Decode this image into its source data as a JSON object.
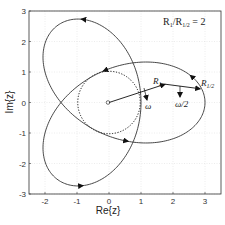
{
  "chart_data": {
    "type": "line",
    "title": "",
    "xlabel": "Re{z}",
    "ylabel": "Im{z}",
    "xlim": [
      -2.5,
      3.5
    ],
    "ylim": [
      -3,
      3
    ],
    "xticks": [
      -2,
      -1,
      0,
      1,
      2,
      3
    ],
    "yticks": [
      3,
      2,
      1,
      0,
      -1,
      -2,
      -3
    ],
    "grid": true,
    "annotation_text": "R1/R1/2 = 2",
    "curve": {
      "name": "trajectory",
      "equation": "z(t) = R1 e^{i ω t} + R1/2 e^{-i ω t/2}",
      "R1": 2,
      "R_half": 1,
      "t_range": [
        0,
        12.566
      ],
      "style": "solid"
    },
    "reference_circle": {
      "center": [
        0,
        0
      ],
      "radius": 1,
      "style": "dotted"
    },
    "vectors": [
      {
        "label": "R1",
        "from": [
          0,
          0
        ],
        "to": [
          1.75,
          0.6
        ]
      },
      {
        "label": "R1/2",
        "from": [
          1.75,
          0.6
        ],
        "to": [
          2.85,
          0.45
        ]
      }
    ],
    "rotation_labels": [
      "ω",
      "ω/2"
    ]
  },
  "legend": {
    "ratio_lhs": "R",
    "ratio_sub1": "1",
    "ratio_mid": "/R",
    "ratio_sub2": "1/2",
    "ratio_rhs": " = 2"
  },
  "labels": {
    "xlabel": "Re{z}",
    "ylabel": "Im{z}",
    "r1": "R",
    "r1_sub": "1",
    "rhalf": "R",
    "rhalf_sub": "1/2",
    "omega": "ω",
    "omega_half": "ω/2"
  },
  "ticks": {
    "x": [
      "-2",
      "-1",
      "0",
      "1",
      "2",
      "3"
    ],
    "y": [
      "3",
      "2",
      "1",
      "0",
      "-1",
      "-2",
      "-3"
    ]
  }
}
